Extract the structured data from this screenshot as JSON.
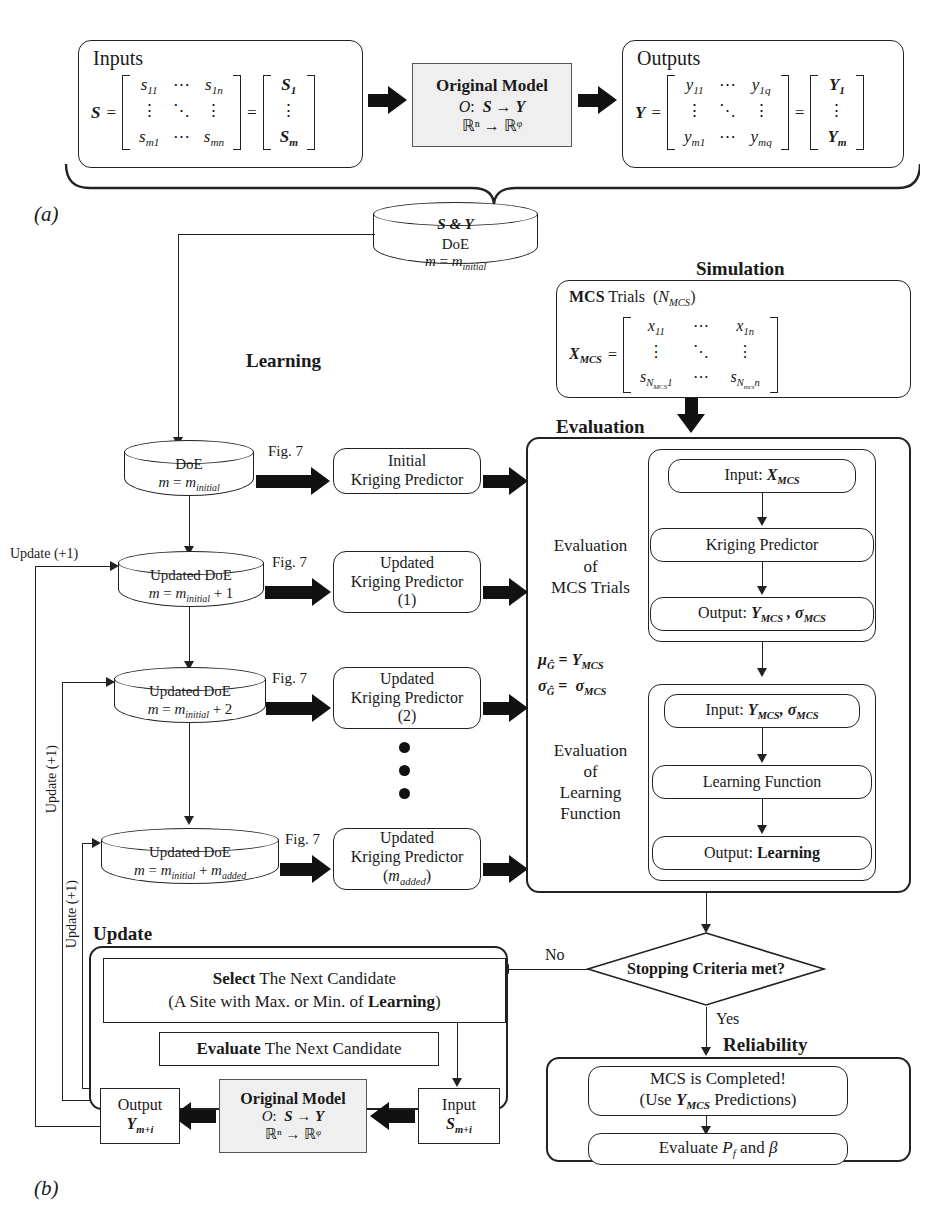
{
  "figure": {
    "panel_a_label": "(a)",
    "panel_b_label": "(b)"
  },
  "panel_a": {
    "inputs": {
      "title": "Inputs",
      "symbol": "S",
      "equals": "=",
      "matrix_cells": [
        "s11",
        "⋯",
        "s1n",
        "⋮",
        "⋱",
        "⋮",
        "sm1",
        "⋯",
        "smn"
      ],
      "vector_cells": [
        "S1",
        "⋮",
        "Sm"
      ]
    },
    "model": {
      "title": "Original Model",
      "mapping": "O:  S → Y",
      "spaces": "ℝⁿ → ℝᵠ"
    },
    "outputs": {
      "title": "Outputs",
      "symbol": "Y",
      "equals": "=",
      "matrix_cells": [
        "y11",
        "⋯",
        "y1q",
        "⋮",
        "⋱",
        "⋮",
        "ym1",
        "⋯",
        "ymq"
      ],
      "vector_cells": [
        "Y1",
        "⋮",
        "Ym"
      ]
    }
  },
  "panel_b": {
    "source_db": {
      "header": "S & Y",
      "line1": "DoE",
      "line2": "m = minitial"
    },
    "section_labels": {
      "learning": "Learning",
      "simulation": "Simulation",
      "evaluation": "Evaluation",
      "update": "Update",
      "reliability": "Reliability"
    },
    "simulation": {
      "trials_label": "MCS Trials  (NMCS)",
      "matrix_symbol": "XMCS",
      "equals": "=",
      "matrix_cells": [
        "x11",
        "⋯",
        "x1n",
        "⋮",
        "⋱",
        "⋮",
        "sNMCS1",
        "⋯",
        "sNmcsn"
      ]
    },
    "learning_rows": [
      {
        "db_line1": "DoE",
        "db_line2": "m = minitial",
        "arrow_label": "Fig. 7",
        "predictor_line1": "Initial",
        "predictor_line2": "Kriging Predictor",
        "predictor_line3": ""
      },
      {
        "db_line1": "Updated DoE",
        "db_line2": "m = minitial + 1",
        "arrow_label": "Fig. 7",
        "predictor_line1": "Updated",
        "predictor_line2": "Kriging Predictor",
        "predictor_line3": "(1)"
      },
      {
        "db_line1": "Updated DoE",
        "db_line2": "m = minitial + 2",
        "arrow_label": "Fig. 7",
        "predictor_line1": "Updated",
        "predictor_line2": "Kriging Predictor",
        "predictor_line3": "(2)"
      },
      {
        "db_line1": "Updated DoE",
        "db_line2": "m = minitial + madded",
        "arrow_label": "Fig. 7",
        "predictor_line1": "Updated",
        "predictor_line2": "Kriging Predictor",
        "predictor_line3": "(madded)"
      }
    ],
    "update_loop_labels": [
      "Update (+1)",
      "Update (+1)",
      "Update (+1)"
    ],
    "evaluation": {
      "group1_caption_l1": "Evaluation",
      "group1_caption_l2": "of",
      "group1_caption_l3": "MCS Trials",
      "group1_steps": [
        "Input: XMCS",
        "Kriging Predictor",
        "Output: YMCS , σMCS"
      ],
      "mapping_line1": "μĜ = YMCS",
      "mapping_line2": "σĜ =  σMCS",
      "group2_caption_l1": "Evaluation",
      "group2_caption_l2": "of",
      "group2_caption_l3": "Learning",
      "group2_caption_l4": "Function",
      "group2_steps": [
        "Input: YMCS, σMCS",
        "Learning Function",
        "Output: Learning"
      ]
    },
    "decision": {
      "question": "Stopping Criteria met?",
      "no_label": "No",
      "yes_label": "Yes"
    },
    "update_panel": {
      "select_line1_bold": "Select",
      "select_line1_rest": " The Next Candidate",
      "select_line2": "(A Site with Max. or Min. of Learning)",
      "evaluate_bold": "Evaluate",
      "evaluate_rest": " The Next Candidate",
      "output_l1": "Output",
      "output_l2": "Ym+i",
      "model_title": "Original Model",
      "model_mapping": "O:  S → Y",
      "model_spaces": "ℝⁿ → ℝᵠ",
      "input_l1": "Input",
      "input_l2": "Sm+i"
    },
    "reliability_panel": {
      "done_l1": "MCS is Completed!",
      "done_l2": "(Use YMCS Predictions)",
      "evaluate": "Evaluate Pf and β"
    }
  },
  "colors": {
    "ink": "#1a1a1a",
    "line": "#222222",
    "shade": "#efefef"
  }
}
